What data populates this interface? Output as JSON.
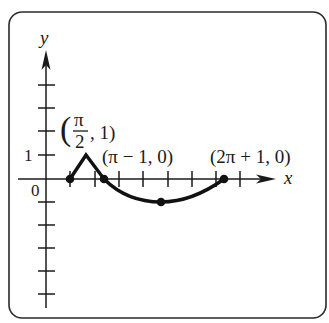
{
  "figure": {
    "axes": {
      "x_label": "x",
      "y_label": "y",
      "origin_label": "0",
      "y_tick_label": "1"
    },
    "points": [
      {
        "id": "start",
        "label": ""
      },
      {
        "id": "peak",
        "label_open": "(",
        "label_num": "π",
        "label_den": "2",
        "label_rest": ", 1)",
        "label": "(π/2, 1)"
      },
      {
        "id": "cross1",
        "label": "(π − 1, 0)"
      },
      {
        "id": "min",
        "label": ""
      },
      {
        "id": "cross2",
        "label": "(2π + 1, 0)"
      }
    ],
    "colors": {
      "ink": "#1a1a1a",
      "frame": "#2a2a2a",
      "background": "#ffffff"
    }
  }
}
